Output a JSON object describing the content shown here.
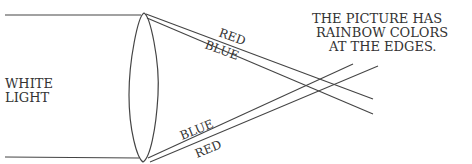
{
  "diagram": {
    "left_label": {
      "line1": "WHITE",
      "line2": "LIGHT"
    },
    "top_rays": {
      "upper_label": "RED",
      "lower_label": "BLUE"
    },
    "bottom_rays": {
      "upper_label": "BLUE",
      "lower_label": "RED"
    },
    "annotation": {
      "line1": "THE PICTURE HAS",
      "line2": "RAINBOW COLORS",
      "line3": "AT THE EDGES."
    },
    "colors": {
      "ink": "#333333",
      "background": "#ffffff"
    }
  }
}
